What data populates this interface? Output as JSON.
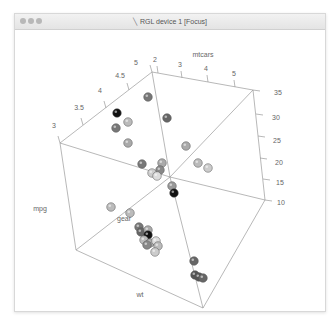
{
  "window": {
    "title": "RGL device 1 [Focus]",
    "title_icon": "x11-icon",
    "buttons": [
      "close",
      "minimize",
      "zoom"
    ]
  },
  "chart_data": {
    "type": "scatter3d",
    "title": "mtcars",
    "xlabel": "wt",
    "ylabel": "gear",
    "zlabel": "mpg",
    "axes": {
      "mpg": {
        "ticks": [
          10,
          15,
          20,
          25,
          30,
          35
        ],
        "range": [
          10,
          35
        ]
      },
      "gear": {
        "ticks": [
          3,
          3.5,
          4,
          4.5,
          5
        ],
        "range": [
          3,
          5
        ]
      },
      "wt": {
        "ticks": [
          2,
          3,
          4,
          5
        ],
        "range": [
          1.5,
          5.5
        ]
      }
    },
    "tick_labels": {
      "gear": [
        "3",
        "3.5",
        "4",
        "4.5",
        "5"
      ],
      "wt": [
        "2",
        "3",
        "4",
        "5"
      ],
      "mpg": [
        "35",
        "30",
        "25",
        "20",
        "15",
        "10"
      ]
    },
    "color_scale": "grayscale",
    "point_count": 32,
    "bounding_box": true
  },
  "labels": {
    "title": "mtcars",
    "x": "wt",
    "y": "gear",
    "z": "mpg"
  },
  "points": [
    {
      "x": 148,
      "y": 97,
      "c": "#777777"
    },
    {
      "x": 117,
      "y": 113,
      "c": "#111111"
    },
    {
      "x": 128,
      "y": 122,
      "c": "#bbbbbb"
    },
    {
      "x": 116,
      "y": 128,
      "c": "#777777"
    },
    {
      "x": 167,
      "y": 118,
      "c": "#666666"
    },
    {
      "x": 128,
      "y": 143,
      "c": "#aaaaaa"
    },
    {
      "x": 186,
      "y": 146,
      "c": "#aaaaaa"
    },
    {
      "x": 198,
      "y": 163,
      "c": "#bbbbbb"
    },
    {
      "x": 208,
      "y": 168,
      "c": "#cccccc"
    },
    {
      "x": 142,
      "y": 164,
      "c": "#777777"
    },
    {
      "x": 162,
      "y": 163,
      "c": "#aaaaaa"
    },
    {
      "x": 160,
      "y": 170,
      "c": "#888888"
    },
    {
      "x": 152,
      "y": 173,
      "c": "#cccccc"
    },
    {
      "x": 157,
      "y": 176,
      "c": "#dddddd"
    },
    {
      "x": 172,
      "y": 186,
      "c": "#999999"
    },
    {
      "x": 174,
      "y": 193,
      "c": "#111111"
    },
    {
      "x": 111,
      "y": 207,
      "c": "#bbbbbb"
    },
    {
      "x": 130,
      "y": 213,
      "c": "#bbbbbb"
    },
    {
      "x": 139,
      "y": 227,
      "c": "#777777"
    },
    {
      "x": 141,
      "y": 232,
      "c": "#666666"
    },
    {
      "x": 148,
      "y": 230,
      "c": "#aaaaaa"
    },
    {
      "x": 148,
      "y": 235,
      "c": "#111111"
    },
    {
      "x": 144,
      "y": 240,
      "c": "#bbbbbb"
    },
    {
      "x": 150,
      "y": 243,
      "c": "#aaaaaa"
    },
    {
      "x": 156,
      "y": 241,
      "c": "#dddddd"
    },
    {
      "x": 147,
      "y": 245,
      "c": "#888888"
    },
    {
      "x": 158,
      "y": 246,
      "c": "#bbbbbb"
    },
    {
      "x": 155,
      "y": 252,
      "c": "#cccccc"
    },
    {
      "x": 194,
      "y": 261,
      "c": "#666666"
    },
    {
      "x": 195,
      "y": 275,
      "c": "#555555"
    },
    {
      "x": 199,
      "y": 277,
      "c": "#555555"
    },
    {
      "x": 203,
      "y": 278,
      "c": "#666666"
    }
  ]
}
